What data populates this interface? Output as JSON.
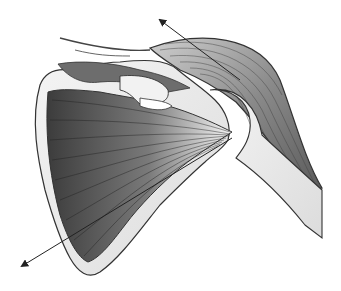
{
  "illustration": {
    "subject": "shoulder muscle anatomy",
    "colors": {
      "background": "#ffffff",
      "bone": "#ececec",
      "muscle_dark": "#4a4a4a",
      "muscle_light": "#f4f4f4",
      "outline": "#333333",
      "arrow": "#222222"
    },
    "arrows": [
      {
        "name": "upward-pull-arrow",
        "from": [
          240,
          80
        ],
        "to": [
          158,
          18
        ]
      },
      {
        "name": "downward-pull-arrow",
        "from": [
          232,
          138
        ],
        "to": [
          20,
          268
        ]
      }
    ]
  }
}
